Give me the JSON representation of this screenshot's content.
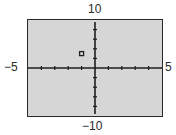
{
  "chart_data": {
    "type": "scatter",
    "title": "",
    "xlabel": "",
    "ylabel": "",
    "xlim": [
      -5,
      5
    ],
    "ylim": [
      -10,
      10
    ],
    "x_tick_step": 1,
    "y_tick_step": 2,
    "grid": false,
    "legend": null,
    "tick_labels": {
      "x_min": "−5",
      "x_max": "5",
      "y_min": "−10",
      "y_max": "10"
    },
    "series": [
      {
        "name": "point",
        "marker": "square",
        "points": [
          {
            "x": -1,
            "y": 3
          }
        ]
      }
    ]
  },
  "colors": {
    "plot_background": "#d6d6d6",
    "axis": "#1e1e1e",
    "frame": "#2a2a2a",
    "marker": "#1e1e1e"
  }
}
